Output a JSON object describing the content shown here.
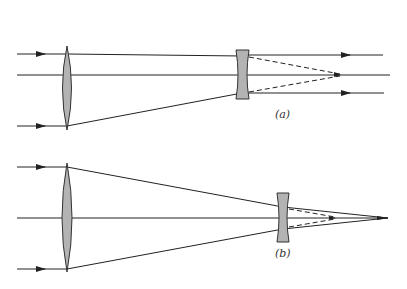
{
  "diagram": {
    "type": "optics-ray-diagram",
    "panels": [
      {
        "id": "a",
        "label": "(a)",
        "elements": [
          "converging-lens",
          "diverging-lens"
        ],
        "description": "Parallel input rays converge through a convex lens, then a concave lens renders them parallel again (afocal / Galilean telescope)."
      },
      {
        "id": "b",
        "label": "(b)",
        "elements": [
          "converging-lens",
          "diverging-lens"
        ],
        "description": "Concave lens placed closer to focus: rays still converge to a point beyond the virtual focus."
      }
    ],
    "colors": {
      "line": "#222222",
      "lens_fill": "#b3b3b3",
      "lens_stroke": "#333333"
    }
  }
}
